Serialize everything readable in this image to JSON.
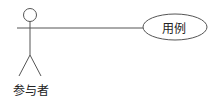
{
  "diagram": {
    "type": "uml-use-case",
    "actor": {
      "label": "参与者"
    },
    "use_case": {
      "label": "用例"
    },
    "association": {
      "from": "参与者",
      "to": "用例"
    },
    "colors": {
      "stroke": "#555555",
      "background": "#ffffff",
      "text": "#222222"
    }
  }
}
